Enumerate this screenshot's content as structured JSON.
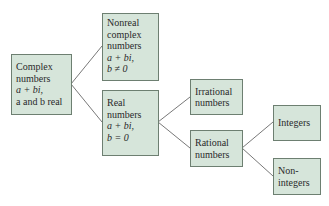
{
  "diagram": {
    "nodes": {
      "complex": {
        "lines": [
          "Complex",
          "numbers",
          "a + bi,",
          "a and b real"
        ]
      },
      "nonreal": {
        "lines": [
          "Nonreal",
          "complex",
          "numbers",
          "a + bi,",
          "b ≠ 0"
        ]
      },
      "real": {
        "lines": [
          "Real",
          "numbers",
          "a + bi,",
          "b = 0"
        ]
      },
      "irrational": {
        "lines": [
          "Irrational",
          "numbers"
        ]
      },
      "rational": {
        "lines": [
          "Rational",
          "numbers"
        ]
      },
      "integers": {
        "lines": [
          "Integers"
        ]
      },
      "nonintegers": {
        "lines": [
          "Non-",
          "integers"
        ]
      }
    },
    "edges": [
      [
        "complex",
        "nonreal"
      ],
      [
        "complex",
        "real"
      ],
      [
        "real",
        "irrational"
      ],
      [
        "real",
        "rational"
      ],
      [
        "rational",
        "integers"
      ],
      [
        "rational",
        "nonintegers"
      ]
    ],
    "colors": {
      "box_fill": "#d6e5da",
      "box_border": "#6d7f71",
      "line": "#555555"
    }
  }
}
